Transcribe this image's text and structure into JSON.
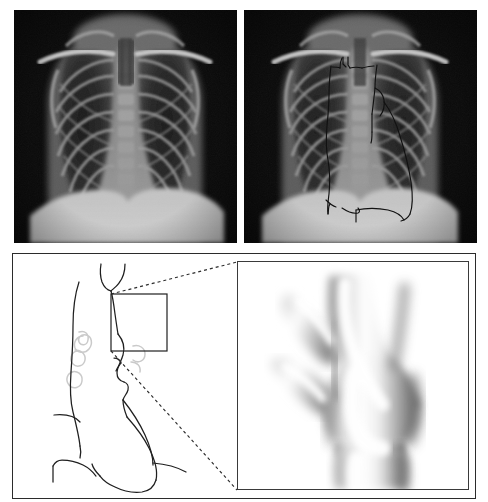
{
  "figure": {
    "width": 488,
    "height": 502,
    "background_color": "#ffffff",
    "panel_border_color": "#2b2b2b"
  },
  "panels": [
    {
      "id": "panel-a",
      "label": "",
      "type": "radiograph",
      "description": "Posteroanterior chest radiograph, unannotated",
      "rect": {
        "x": 14,
        "y": 10,
        "width": 223,
        "height": 233
      },
      "colors": {
        "background": "#0b0b0b",
        "soft_tissue": "#6e6e6e",
        "lung_field": "#262626",
        "bone": "#b4b4b4",
        "diaphragm": "#c8c8c8",
        "mediastinum": "#8a8a8a"
      }
    },
    {
      "id": "panel-b",
      "label": "",
      "type": "radiograph-annotated",
      "description": "Same chest radiograph with hand-drawn mediastinal and cardiac border tracings",
      "rect": {
        "x": 244,
        "y": 10,
        "width": 233,
        "height": 233
      },
      "overlay": {
        "stroke_color": "#101010",
        "stroke_width": 1.1,
        "traced_structures": [
          "right paratracheal stripe",
          "superior vena cava border",
          "aortic arch knob",
          "left pulmonary artery",
          "left heart border",
          "right heart border",
          "descending aorta",
          "trachea",
          "carina",
          "diaphragm contour"
        ]
      },
      "colors": {
        "background": "#0b0b0b",
        "soft_tissue": "#6e6e6e",
        "lung_field": "#262626",
        "bone": "#b4b4b4",
        "diaphragm": "#c8c8c8",
        "mediastinum": "#8a8a8a"
      }
    },
    {
      "id": "panel-c",
      "label": "",
      "type": "line-schematic",
      "description": "Line-drawing schematic of mediastinal contours with a region-of-interest box over the aortic arch",
      "rect": {
        "x": 12,
        "y": 253,
        "width": 224,
        "height": 243
      },
      "roi_box": {
        "x": 110,
        "y": 293,
        "width": 56,
        "height": 57
      },
      "colors": {
        "line": "#1f1f1f",
        "faint_line": "#c9c9c9",
        "dashed": "#2b2b2b",
        "background": "#ffffff"
      }
    },
    {
      "id": "panel-d",
      "label": "",
      "type": "volume-render",
      "description": "Magnified shaded 3D surface reconstruction of the aortic arch showing a saccular aneurysmal dilatation and branch vessel origins",
      "rect": {
        "x": 236,
        "y": 260,
        "width": 232,
        "height": 229
      },
      "colors": {
        "background": "#ffffff",
        "highlight": "#ffffff",
        "midtone": "#bdbdbd",
        "shadow": "#6a6a6a",
        "border": "#3a3a3a"
      }
    }
  ],
  "connectors": {
    "type": "dashed-magnifier-leader",
    "color": "#2b2b2b",
    "dash_pattern": "3 3",
    "upper": {
      "from": {
        "x": 110,
        "y": 293
      },
      "to": {
        "x": 236,
        "y": 262
      }
    },
    "lower": {
      "from": {
        "x": 110,
        "y": 350
      },
      "to": {
        "x": 236,
        "y": 489
      }
    }
  },
  "icons": {
    "roi_box": "magnifier-region-box",
    "leader": "dashed-leader-line"
  }
}
